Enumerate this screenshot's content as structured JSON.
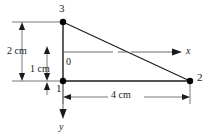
{
  "figure": {
    "type": "engineering-diagram",
    "background_color": "#ffffff",
    "line_color": "#1a1a1a",
    "node_color": "#000000",
    "width": 215,
    "height": 138
  },
  "nodes": [
    {
      "id": "node-3",
      "label": "3",
      "x": 63,
      "y": 22,
      "label_x": 59,
      "label_y": 4
    },
    {
      "id": "node-1",
      "label": "1",
      "x": 63,
      "y": 81,
      "label_x": 56,
      "label_y": 83
    },
    {
      "id": "node-2",
      "label": "2",
      "x": 190,
      "y": 81,
      "label_x": 197,
      "label_y": 73
    }
  ],
  "origin": {
    "label": "0",
    "x": 63,
    "y": 52,
    "label_x": 66,
    "label_y": 58
  },
  "axes": [
    {
      "id": "x-axis",
      "label": "x",
      "label_x": 186,
      "label_y": 46,
      "direction": "right"
    },
    {
      "id": "y-axis",
      "label": "y",
      "label_x": 59,
      "label_y": 123,
      "direction": "down"
    }
  ],
  "dimensions": [
    {
      "id": "dim-2cm",
      "label": "2 cm",
      "label_x": 8,
      "label_y": 47,
      "orientation": "vertical",
      "from": 22,
      "to": 81
    },
    {
      "id": "dim-1cm",
      "label": "1 cm",
      "label_x": 31,
      "label_y": 65,
      "orientation": "vertical",
      "from": 46,
      "to": 81
    },
    {
      "id": "dim-4cm",
      "label": "4 cm",
      "label_x": 112,
      "label_y": 91,
      "orientation": "horizontal",
      "from": 63,
      "to": 190
    }
  ]
}
